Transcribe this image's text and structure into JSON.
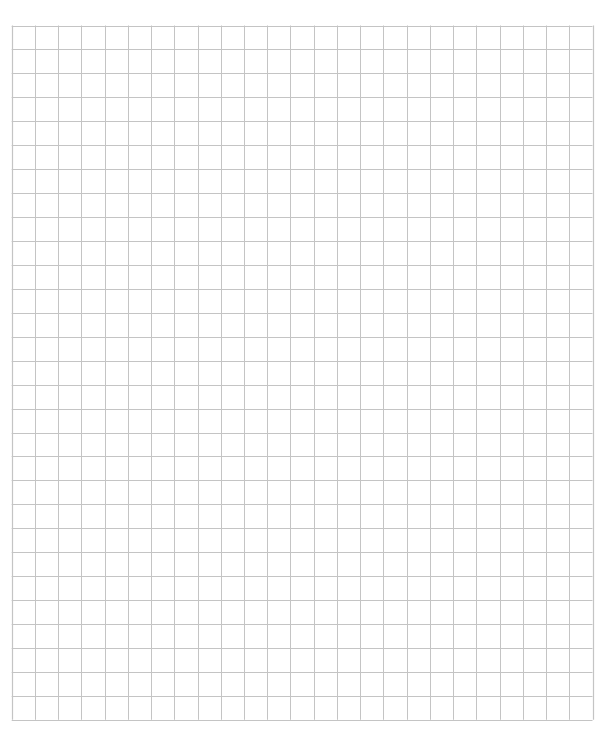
{
  "sheet": {
    "kind": "graph-paper",
    "columns": 25,
    "rows": 29,
    "line_color": "#c4c4c4",
    "background_color": "#ffffff"
  }
}
